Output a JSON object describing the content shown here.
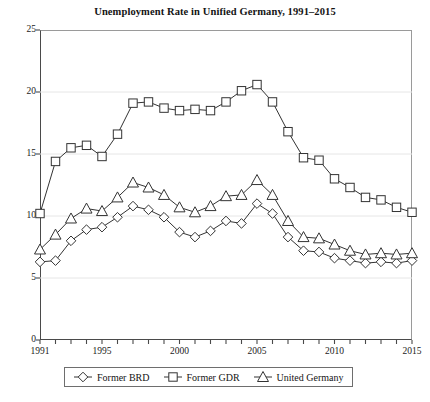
{
  "chart_data": {
    "type": "line",
    "title": "Unemployment Rate in Unified Germany, 1991–2015",
    "xlabel": "",
    "ylabel": "",
    "xlim": [
      1991,
      2015
    ],
    "ylim": [
      0,
      25
    ],
    "yticks": [
      0,
      5,
      10,
      15,
      20,
      25
    ],
    "xticks": [
      1991,
      1992,
      1993,
      1994,
      1995,
      1996,
      1997,
      1998,
      1999,
      2000,
      2001,
      2002,
      2003,
      2004,
      2005,
      2006,
      2007,
      2008,
      2009,
      2010,
      2011,
      2012,
      2013,
      2014,
      2015
    ],
    "xtick_labels": [
      "1991",
      "",
      "",
      "",
      "1995",
      "",
      "",
      "",
      "",
      "2000",
      "",
      "",
      "",
      "",
      "2005",
      "",
      "",
      "",
      "",
      "2010",
      "",
      "",
      "",
      "",
      "2015"
    ],
    "grid": true,
    "grid_axis": "y",
    "legend_position": "bottom",
    "x": [
      1991,
      1992,
      1993,
      1994,
      1995,
      1996,
      1997,
      1998,
      1999,
      2000,
      2001,
      2002,
      2003,
      2004,
      2005,
      2006,
      2007,
      2008,
      2009,
      2010,
      2011,
      2012,
      2013,
      2014,
      2015
    ],
    "series": [
      {
        "name": "Former BRD",
        "marker": "diamond",
        "color": "#333333",
        "values": [
          6.3,
          6.4,
          8.0,
          8.9,
          9.1,
          9.9,
          10.8,
          10.5,
          9.9,
          8.7,
          8.3,
          8.8,
          9.6,
          9.4,
          11.0,
          10.2,
          8.3,
          7.2,
          7.1,
          6.6,
          6.4,
          6.2,
          6.3,
          6.2,
          6.4
        ],
        "label_unit": "%"
      },
      {
        "name": "Former GDR",
        "marker": "square",
        "color": "#333333",
        "values": [
          10.2,
          14.4,
          15.5,
          15.7,
          14.8,
          16.6,
          19.1,
          19.2,
          18.7,
          18.5,
          18.6,
          18.5,
          19.2,
          20.1,
          20.6,
          19.2,
          16.8,
          14.7,
          14.5,
          13.0,
          12.3,
          11.5,
          11.3,
          10.7,
          10.3
        ]
      },
      {
        "name": "United Germany",
        "marker": "triangle",
        "color": "#333333",
        "values": [
          7.3,
          8.5,
          9.8,
          10.6,
          10.4,
          11.5,
          12.7,
          12.3,
          11.7,
          10.7,
          10.3,
          10.8,
          11.6,
          11.7,
          12.9,
          11.7,
          9.6,
          8.3,
          8.2,
          7.7,
          7.2,
          6.9,
          7.0,
          6.9,
          7.0
        ]
      }
    ]
  },
  "legend": {
    "items": [
      {
        "label": "Former BRD",
        "marker": "diamond"
      },
      {
        "label": "Former GDR",
        "marker": "square"
      },
      {
        "label": "United Germany",
        "marker": "triangle"
      }
    ]
  }
}
